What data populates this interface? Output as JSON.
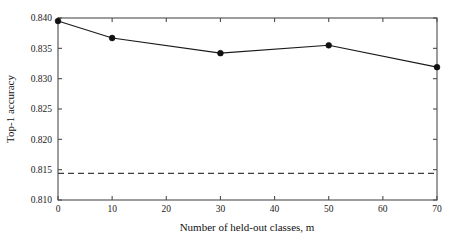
{
  "chart_data": {
    "type": "line",
    "title": "",
    "xlabel": "Number of held-out classes, m",
    "ylabel": "Top-1 accuracy",
    "x": [
      0,
      10,
      30,
      50,
      70
    ],
    "values": [
      0.8395,
      0.8367,
      0.8342,
      0.8355,
      0.8319
    ],
    "series": [
      {
        "name": "Top-1 accuracy",
        "x": [
          0,
          10,
          30,
          50,
          70
        ],
        "values": [
          0.8395,
          0.8367,
          0.8342,
          0.8355,
          0.8319
        ],
        "marker": "circle",
        "linestyle": "solid",
        "color": "#111111"
      }
    ],
    "annotations": [
      {
        "type": "hline",
        "name": "baseline",
        "y": 0.8144,
        "linestyle": "dashed",
        "color": "#3c3c3c"
      }
    ],
    "xlim": [
      0,
      70
    ],
    "ylim": [
      0.81,
      0.84
    ],
    "xticks": [
      0,
      10,
      20,
      30,
      40,
      50,
      60,
      70
    ],
    "yticks": [
      0.81,
      0.815,
      0.82,
      0.825,
      0.83,
      0.835,
      0.84
    ],
    "xtick_labels": [
      "0",
      "10",
      "20",
      "30",
      "40",
      "50",
      "60",
      "70"
    ],
    "ytick_labels": [
      "0.810",
      "0.815",
      "0.820",
      "0.825",
      "0.830",
      "0.835",
      "0.840"
    ],
    "grid": false,
    "legend": null,
    "legend_position": "none",
    "frame": "box",
    "tick_direction": "in"
  },
  "figure": {
    "background_color": "#ffffff",
    "axes_color": "#4d4d4d",
    "text_color": "#111111"
  }
}
